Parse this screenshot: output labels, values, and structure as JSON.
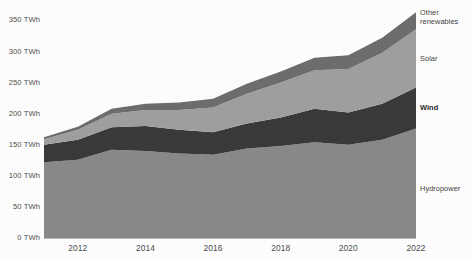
{
  "chart_data": {
    "type": "area",
    "title": "",
    "subtitle": "",
    "xlabel": "",
    "ylabel": "",
    "stacked": true,
    "grid": false,
    "legend_position": "right-inline-labels",
    "x": [
      2011,
      2012,
      2013,
      2014,
      2015,
      2016,
      2017,
      2018,
      2019,
      2020,
      2021,
      2022
    ],
    "xlim": [
      2011,
      2022
    ],
    "ylim": [
      0,
      370
    ],
    "x_tick_labels": [
      "2012",
      "2014",
      "2016",
      "2018",
      "2020",
      "2022"
    ],
    "x_tick_values": [
      2012,
      2014,
      2016,
      2018,
      2020,
      2022
    ],
    "y_tick_labels": [
      "0 TWh",
      "50 TWh",
      "100 TWh",
      "150 TWh",
      "200 TWh",
      "250 TWh",
      "300 TWh",
      "350 TWh"
    ],
    "y_tick_values": [
      0,
      50,
      100,
      150,
      200,
      250,
      300,
      350
    ],
    "unit": "TWh",
    "series": [
      {
        "name": "Hydropower",
        "label": "Hydropower",
        "color": "#8a8a8a",
        "values": [
          122,
          126,
          142,
          140,
          136,
          134,
          144,
          148,
          154,
          150,
          158,
          176
        ]
      },
      {
        "name": "Wind",
        "label": "Wind",
        "color": "#3a3a3a",
        "values": [
          28,
          32,
          36,
          40,
          38,
          36,
          40,
          46,
          54,
          52,
          58,
          66
        ]
      },
      {
        "name": "Solar",
        "label": "Solar",
        "color": "#a0a0a0",
        "values": [
          9,
          16,
          22,
          26,
          32,
          40,
          48,
          56,
          62,
          70,
          82,
          94
        ]
      },
      {
        "name": "Other renewables",
        "label": "Other\nrenewables",
        "color": "#6e6e6e",
        "values": [
          3,
          5,
          8,
          10,
          12,
          14,
          16,
          18,
          20,
          22,
          24,
          27
        ]
      }
    ],
    "series_totals": [
      162,
      179,
      208,
      216,
      218,
      224,
      248,
      268,
      290,
      294,
      322,
      363
    ],
    "colors": {
      "hydropower": "#8a8a8a",
      "wind": "#3a3a3a",
      "solar": "#a0a0a0",
      "other_renewables": "#6e6e6e",
      "axis_text": "#4d4d4d",
      "background": "#ffffff"
    }
  },
  "axis": {
    "y_labels": [
      {
        "text": "350 TWh",
        "value": 350
      },
      {
        "text": "300 TWh",
        "value": 300
      },
      {
        "text": "250 TWh",
        "value": 250
      },
      {
        "text": "200 TWh",
        "value": 200
      },
      {
        "text": "150 TWh",
        "value": 150
      },
      {
        "text": "100 TWh",
        "value": 100
      },
      {
        "text": "50 TWh",
        "value": 50
      },
      {
        "text": "0 TWh",
        "value": 0
      }
    ],
    "x_labels": [
      {
        "text": "2012",
        "value": 2012
      },
      {
        "text": "2014",
        "value": 2014
      },
      {
        "text": "2016",
        "value": 2016
      },
      {
        "text": "2018",
        "value": 2018
      },
      {
        "text": "2020",
        "value": 2020
      },
      {
        "text": "2022",
        "value": 2022
      }
    ]
  },
  "labels": {
    "other_renewables": "Other\nrenewables",
    "solar": "Solar",
    "wind": "Wind",
    "hydropower": "Hydropower"
  }
}
